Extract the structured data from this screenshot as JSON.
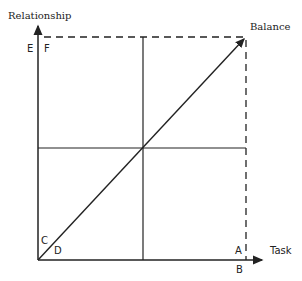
{
  "diagram": {
    "axes": {
      "y_label": "Relationship",
      "x_label": "Task"
    },
    "points": {
      "balance": "Balance",
      "E": "E",
      "F": "F",
      "C": "C",
      "D": "D",
      "A": "A",
      "B": "B"
    },
    "colors": {
      "line": "#222222",
      "background": "#ffffff"
    }
  }
}
